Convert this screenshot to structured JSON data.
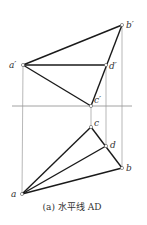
{
  "diagram": {
    "caption": "(a) 水平线 AD",
    "ground_line": {
      "x1": 12,
      "x2": 132,
      "y": 106
    },
    "points": {
      "b_prime": {
        "label": "b′",
        "x": 122,
        "y": 25
      },
      "a_prime": {
        "label": "a′",
        "x": 23,
        "y": 65
      },
      "d_prime": {
        "label": "d′",
        "x": 106,
        "y": 65
      },
      "c_prime": {
        "label": "c′",
        "x": 91,
        "y": 106
      },
      "c": {
        "label": "c",
        "x": 91,
        "y": 127
      },
      "d": {
        "label": "d",
        "x": 106,
        "y": 146
      },
      "b": {
        "label": "b",
        "x": 122,
        "y": 168
      },
      "a": {
        "label": "a",
        "x": 22,
        "y": 194
      }
    },
    "colors": {
      "edge": "#1a1a1a",
      "projector": "#9a9a9a",
      "ground": "#8a8a8a"
    }
  }
}
